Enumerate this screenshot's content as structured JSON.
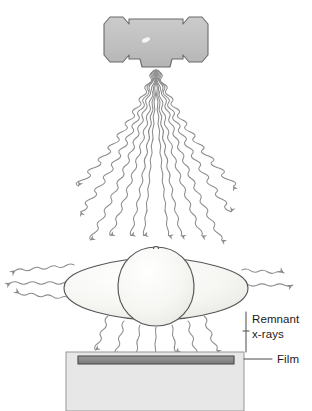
{
  "figure": {
    "canvas": {
      "width": 312,
      "height": 411,
      "background": "#ffffff"
    }
  },
  "labels": {
    "remnant_line1": "Remnant",
    "remnant_line2": "x-rays",
    "film": "Film"
  },
  "components": {
    "tube_housing": {
      "name": "x-ray tube housing",
      "fill": "#c2c2c2",
      "stroke": "#6e6e6e"
    },
    "patient": {
      "name": "patient body",
      "fill": "#f4f4f2",
      "stroke": "#5a5a5a"
    },
    "cassette": {
      "name": "film cassette",
      "fill": "#e7e7e7",
      "stroke": "#9a9a9a"
    },
    "film_strip": {
      "name": "radiographic film",
      "fill": "#8a8a8a",
      "stroke": "#4a4a4a"
    },
    "primary_beam": {
      "name": "primary x-ray beam",
      "stroke": "#8c8c8c",
      "ray_count": 11
    },
    "scatter_left": {
      "name": "scattered radiation left",
      "stroke": "#8c8c8c",
      "ray_count": 3
    },
    "scatter_right": {
      "name": "scattered radiation right",
      "stroke": "#8c8c8c",
      "ray_count": 2
    },
    "remnant_beam": {
      "name": "remnant x-ray beam",
      "stroke": "#8c8c8c",
      "ray_count": 7
    },
    "leader_lines": {
      "name": "label leader lines",
      "stroke": "#4a4a4a"
    }
  },
  "geometry": {
    "source": {
      "x": 156,
      "y": 66
    },
    "body_center": {
      "x": 156,
      "y": 284
    },
    "film_top_y": 352,
    "cassette": {
      "x": 66,
      "y": 352,
      "w": 178,
      "h": 59
    },
    "film_strip": {
      "x": 78,
      "y": 356,
      "w": 156,
      "h": 8
    },
    "primary_fan_top_y": 70,
    "primary_fan_bottom_y": 258,
    "primary_fan_half_width": 107,
    "remnant_top_y": 312,
    "remnant_bottom_y": 350
  }
}
